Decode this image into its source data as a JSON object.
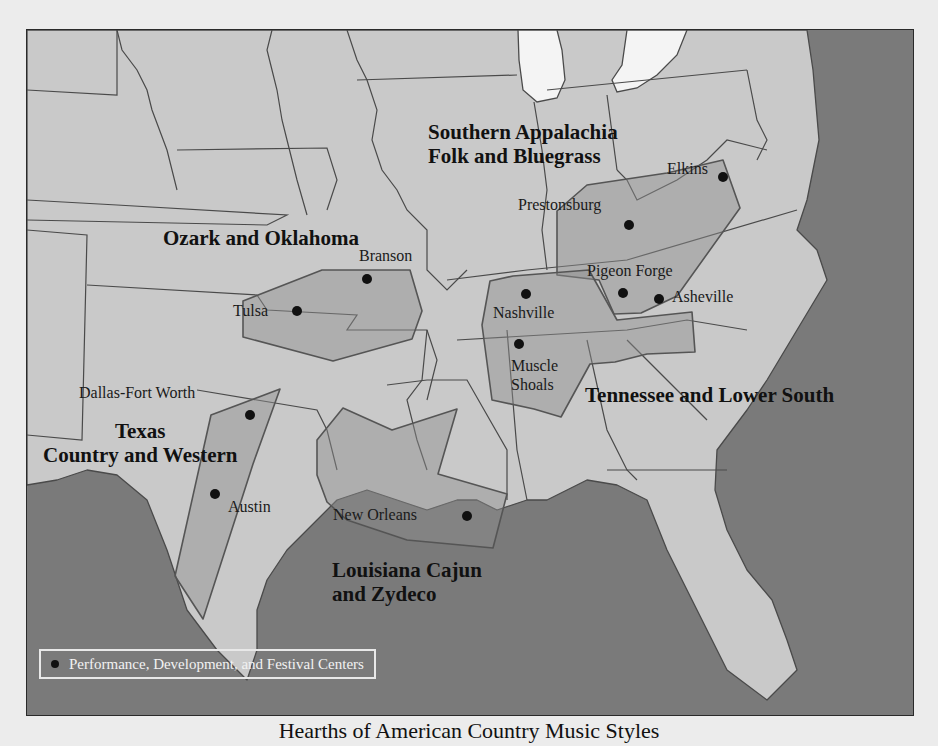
{
  "caption": "Hearths of American Country Music Styles",
  "legend": {
    "marker": "black-dot",
    "label": "Performance, Development, and Festival Centers"
  },
  "colors": {
    "ocean": "#7a7a7a",
    "land": "#c9c9c9",
    "lakes": "#f4f4f4",
    "hearth_fill": "#8f8f8f",
    "city_marker": "#111111",
    "legend_text": "#f2f2f2"
  },
  "regions": [
    {
      "id": "southern-appalachia",
      "label_lines": [
        "Southern Appalachia",
        "Folk and Bluegrass"
      ],
      "cities": [
        "Prestonsburg",
        "Elkins",
        "Pigeon Forge",
        "Asheville"
      ]
    },
    {
      "id": "ozark-oklahoma",
      "label_lines": [
        "Ozark and Oklahoma"
      ],
      "cities": [
        "Branson",
        "Tulsa"
      ]
    },
    {
      "id": "tennessee-lower-south",
      "label_lines": [
        "Tennessee and Lower South"
      ],
      "cities": [
        "Nashville",
        "Muscle Shoals"
      ]
    },
    {
      "id": "texas",
      "label_lines": [
        "Texas",
        "Country and Western"
      ],
      "cities": [
        "Dallas-Fort Worth",
        "Austin"
      ]
    },
    {
      "id": "louisiana",
      "label_lines": [
        "Louisiana Cajun",
        "and Zydeco"
      ],
      "cities": [
        "New Orleans"
      ]
    }
  ],
  "cities": [
    {
      "name": "Branson",
      "x": 340,
      "y": 249
    },
    {
      "name": "Tulsa",
      "x": 270,
      "y": 281
    },
    {
      "name": "Prestonsburg",
      "x": 602,
      "y": 195
    },
    {
      "name": "Elkins",
      "x": 696,
      "y": 147
    },
    {
      "name": "Pigeon Forge",
      "x": 596,
      "y": 263
    },
    {
      "name": "Asheville",
      "x": 632,
      "y": 269
    },
    {
      "name": "Nashville",
      "x": 499,
      "y": 264
    },
    {
      "name": "Muscle Shoals",
      "x": 492,
      "y": 314
    },
    {
      "name": "Dallas-Fort Worth",
      "x": 223,
      "y": 385
    },
    {
      "name": "Austin",
      "x": 188,
      "y": 464
    },
    {
      "name": "New Orleans",
      "x": 440,
      "y": 486
    }
  ],
  "labels": {
    "sa_line1": "Southern Appalachia",
    "sa_line2": "Folk and Bluegrass",
    "ozark": "Ozark and Oklahoma",
    "tls": "Tennessee and Lower South",
    "tx_line1": "Texas",
    "tx_line2": "Country and Western",
    "la_line1": "Louisiana Cajun",
    "la_line2": "and Zydeco",
    "branson": "Branson",
    "tulsa": "Tulsa",
    "prestonsburg": "Prestonsburg",
    "elkins": "Elkins",
    "pigeon_forge": "Pigeon Forge",
    "asheville": "Asheville",
    "nashville": "Nashville",
    "muscle": "Muscle",
    "shoals": "Shoals",
    "dfw": "Dallas-Fort Worth",
    "austin": "Austin",
    "new_orleans": "New Orleans"
  }
}
